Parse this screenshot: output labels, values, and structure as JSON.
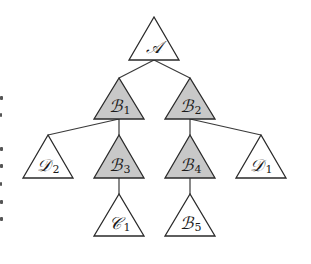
{
  "diagram": {
    "type": "tree",
    "colors": {
      "shaded_fill": "#c8c8c8",
      "plain_fill": "#ffffff",
      "stroke": "#2a2a2a"
    },
    "nodes": [
      {
        "id": "A",
        "letter": "𝒜",
        "subscript": "",
        "shaded": false,
        "parent": null
      },
      {
        "id": "B1",
        "letter": "ℬ",
        "subscript": "1",
        "shaded": true,
        "parent": "A"
      },
      {
        "id": "B2",
        "letter": "ℬ",
        "subscript": "2",
        "shaded": true,
        "parent": "A"
      },
      {
        "id": "D2",
        "letter": "𝒟",
        "subscript": "2",
        "shaded": false,
        "parent": "B1"
      },
      {
        "id": "B3",
        "letter": "ℬ",
        "subscript": "3",
        "shaded": true,
        "parent": "B1"
      },
      {
        "id": "B4",
        "letter": "ℬ",
        "subscript": "4",
        "shaded": true,
        "parent": "B2"
      },
      {
        "id": "D1",
        "letter": "𝒟",
        "subscript": "1",
        "shaded": false,
        "parent": "B2"
      },
      {
        "id": "C1",
        "letter": "𝒞",
        "subscript": "1",
        "shaded": false,
        "parent": "B3"
      },
      {
        "id": "B5",
        "letter": "ℬ",
        "subscript": "5",
        "shaded": false,
        "parent": "B4"
      }
    ]
  }
}
